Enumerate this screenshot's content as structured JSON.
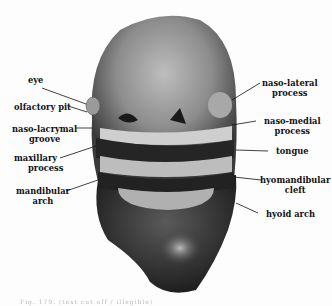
{
  "figure": {
    "labels_left": [
      {
        "id": "eye",
        "text": "eye"
      },
      {
        "id": "olfactory-pit",
        "text": "olfactory pit"
      },
      {
        "id": "naso-lacrymal-groove",
        "line1": "naso-lacrymal",
        "line2": "groove"
      },
      {
        "id": "maxillary-process",
        "line1": "maxillary",
        "line2": "process"
      },
      {
        "id": "mandibular-arch",
        "line1": "mandibular",
        "line2": "arch"
      }
    ],
    "labels_right": [
      {
        "id": "naso-lateral-process",
        "line1": "naso-lateral",
        "line2": "process"
      },
      {
        "id": "naso-medial-process",
        "line1": "naso-medial",
        "line2": "process"
      },
      {
        "id": "tongue",
        "text": "tongue"
      },
      {
        "id": "hyomandibular-cleft",
        "line1": "hyomandibular",
        "line2": "cleft"
      },
      {
        "id": "hyoid-arch",
        "text": "hyoid arch"
      }
    ],
    "caption": "Fig. 179. (text cut off / illegible)"
  },
  "colors": {
    "background": "#fdfdfd",
    "tissue_dark": "#2a2a2a",
    "tissue_mid": "#6e6e6e",
    "tissue_light": "#c8c8c8",
    "label_text": "#111111",
    "leader_line": "#111111"
  }
}
